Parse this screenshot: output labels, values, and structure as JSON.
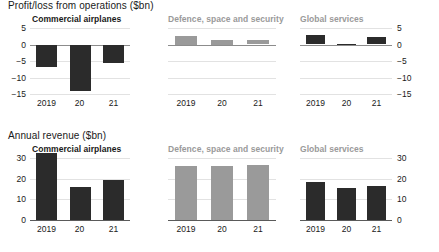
{
  "sections": [
    {
      "heading": "Profit/loss from operations ($bn)"
    },
    {
      "heading": "Annual revenue ($bn)"
    }
  ],
  "panel_titles": {
    "commercial_airplanes": "Commercial airplanes",
    "defence": "Defence, space and security",
    "global_services": "Global services"
  },
  "axis": {
    "profit_ticks": [
      "5",
      "0",
      "-5",
      "-10",
      "-15"
    ],
    "revenue_ticks": [
      "30",
      "20",
      "10",
      "0"
    ],
    "categories": [
      "2019",
      "20",
      "21"
    ]
  },
  "colors": {
    "bar_dark": "#2b2b2b",
    "bar_gray": "#9a9a9a",
    "grid": "#e2e2e2",
    "axis": "#5a5a5a",
    "muted_title": "#9a9a9a"
  },
  "chart_data": [
    {
      "type": "bar",
      "title": "Commercial airplanes",
      "subtitle": "Profit/loss from operations ($bn)",
      "categories": [
        "2019",
        "20",
        "21"
      ],
      "values": [
        -6.7,
        -13.8,
        -5.4
      ],
      "xlabel": "",
      "ylabel": "$bn",
      "ylim": [
        -15,
        5
      ],
      "yticks": [
        5,
        0,
        -5,
        -10,
        -15
      ],
      "grid": true,
      "legend": "none",
      "bar_color": "#2b2b2b"
    },
    {
      "type": "bar",
      "title": "Defence, space and security",
      "subtitle": "Profit/loss from operations ($bn)",
      "categories": [
        "2019",
        "20",
        "21"
      ],
      "values": [
        2.6,
        1.4,
        1.3
      ],
      "xlabel": "",
      "ylabel": "$bn",
      "ylim": [
        -15,
        5
      ],
      "yticks": [
        5,
        0,
        -5,
        -10,
        -15
      ],
      "grid": true,
      "legend": "none",
      "bar_color": "#9a9a9a"
    },
    {
      "type": "bar",
      "title": "Global services",
      "subtitle": "Profit/loss from operations ($bn)",
      "categories": [
        "2019",
        "20",
        "21"
      ],
      "values": [
        2.8,
        0.3,
        2.2
      ],
      "xlabel": "",
      "ylabel": "$bn",
      "ylim": [
        -15,
        5
      ],
      "yticks": [
        5,
        0,
        -5,
        -10,
        -15
      ],
      "grid": true,
      "legend": "none",
      "bar_color": "#2b2b2b"
    },
    {
      "type": "bar",
      "title": "Commercial airplanes",
      "subtitle": "Annual revenue ($bn)",
      "categories": [
        "2019",
        "20",
        "21"
      ],
      "values": [
        32.3,
        16.2,
        19.5
      ],
      "xlabel": "",
      "ylabel": "$bn",
      "ylim": [
        0,
        30
      ],
      "yticks": [
        30,
        20,
        10,
        0
      ],
      "grid": true,
      "legend": "none",
      "bar_color": "#2b2b2b"
    },
    {
      "type": "bar",
      "title": "Defence, space and security",
      "subtitle": "Annual revenue ($bn)",
      "categories": [
        "2019",
        "20",
        "21"
      ],
      "values": [
        26.2,
        26.3,
        26.5
      ],
      "xlabel": "",
      "ylabel": "$bn",
      "ylim": [
        0,
        30
      ],
      "yticks": [
        30,
        20,
        10,
        0
      ],
      "grid": true,
      "legend": "none",
      "bar_color": "#9a9a9a"
    },
    {
      "type": "bar",
      "title": "Global services",
      "subtitle": "Annual revenue ($bn)",
      "categories": [
        "2019",
        "20",
        "21"
      ],
      "values": [
        18.5,
        15.5,
        16.3
      ],
      "xlabel": "",
      "ylabel": "$bn",
      "ylim": [
        0,
        30
      ],
      "yticks": [
        30,
        20,
        10,
        0
      ],
      "grid": true,
      "legend": "none",
      "bar_color": "#2b2b2b"
    }
  ]
}
